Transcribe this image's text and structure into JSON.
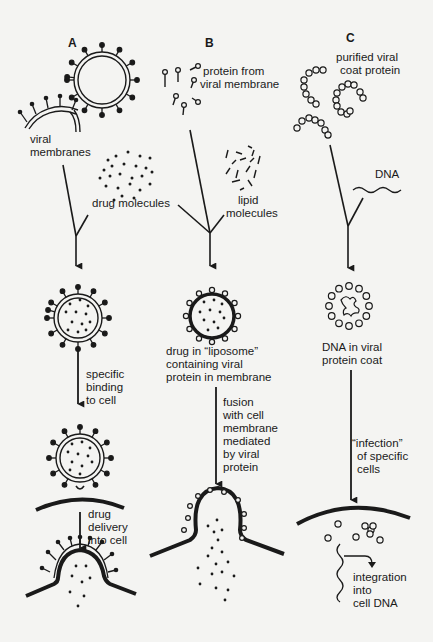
{
  "panels": [
    {
      "letter": "A",
      "labels": {
        "viral_membranes": [
          "viral",
          "membranes"
        ],
        "drug_molecules": "drug molecules",
        "binding": [
          "specific",
          "binding",
          "to cell"
        ],
        "delivery": [
          "drug",
          "delivery",
          "into cell"
        ]
      }
    },
    {
      "letter": "B",
      "labels": {
        "protein": [
          "protein from",
          "viral membrane"
        ],
        "lipid": [
          "lipid",
          "molecules"
        ],
        "liposome": [
          "drug in “liposome”",
          "containing viral",
          "protein in membrane"
        ],
        "fusion": [
          "fusion",
          "with cell",
          "membrane",
          "mediated",
          "by viral",
          "protein"
        ]
      }
    },
    {
      "letter": "C",
      "labels": {
        "coat": [
          "purified viral",
          "coat protein"
        ],
        "dna": "DNA",
        "dna_in_coat": [
          "DNA in viral",
          "protein coat"
        ],
        "infection": [
          "“infection”",
          "of specific",
          "cells"
        ],
        "integration": [
          "integration",
          "into",
          "cell DNA"
        ]
      }
    }
  ],
  "colors": {
    "ink": "#1a1a1a",
    "background": "#f4f4f2"
  }
}
